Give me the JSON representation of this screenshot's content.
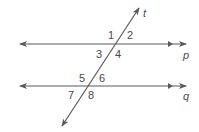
{
  "diagram": {
    "type": "parallel-lines-transversal",
    "lines": {
      "p": {
        "label": "p",
        "y": 44,
        "x1": 20,
        "x2": 186
      },
      "q": {
        "label": "q",
        "y": 86,
        "x1": 20,
        "x2": 186
      },
      "t": {
        "label": "t",
        "x1": 62,
        "y1": 126,
        "x2": 139,
        "y2": 8
      }
    },
    "angles": [
      {
        "label": "1",
        "x": 108,
        "y": 39
      },
      {
        "label": "2",
        "x": 127,
        "y": 39
      },
      {
        "label": "3",
        "x": 96,
        "y": 58
      },
      {
        "label": "4",
        "x": 115,
        "y": 58
      },
      {
        "label": "5",
        "x": 79,
        "y": 82
      },
      {
        "label": "6",
        "x": 99,
        "y": 82
      },
      {
        "label": "7",
        "x": 68,
        "y": 99
      },
      {
        "label": "8",
        "x": 88,
        "y": 99
      }
    ],
    "line_labels": {
      "t": "t",
      "p": "p",
      "q": "q"
    },
    "colors": {
      "line": "#5a5a5a",
      "text": "#4a4a4a",
      "background": "#ffffff"
    }
  }
}
